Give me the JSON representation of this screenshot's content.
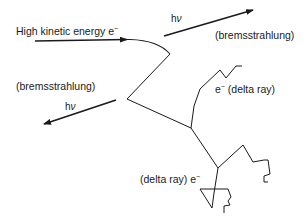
{
  "diagram": {
    "title": "",
    "labels": {
      "incident_electron": {
        "text": "High kinetic energy e",
        "superscript": "−"
      },
      "photon_top_symbol": {
        "h": "h",
        "nu": "ν"
      },
      "photon_top_caption": "(bremsstrahlung)",
      "photon_left_caption": "(bremsstrahlung)",
      "photon_left_symbol": {
        "h": "h",
        "nu": "ν"
      },
      "delta_ray_upper": {
        "prefix": "e",
        "superscript": "−",
        "suffix": " (delta ray)"
      },
      "delta_ray_lower": {
        "text": "(delta ray) e",
        "superscript": "−"
      }
    },
    "colors": {
      "line": "#1a1a1a",
      "background": "#ffffff"
    }
  }
}
